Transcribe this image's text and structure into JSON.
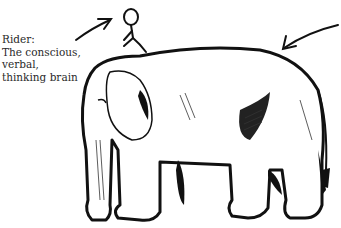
{
  "figure": {
    "label": {
      "lines": [
        "Rider:",
        "The conscious,",
        "verbal,",
        "thinking brain"
      ]
    },
    "subjects": [
      "rider-stick-figure",
      "elephant"
    ],
    "arrows": [
      "arrow-to-rider",
      "arrow-to-elephant"
    ],
    "colors": {
      "ink": "#111111",
      "background": "#ffffff"
    }
  }
}
